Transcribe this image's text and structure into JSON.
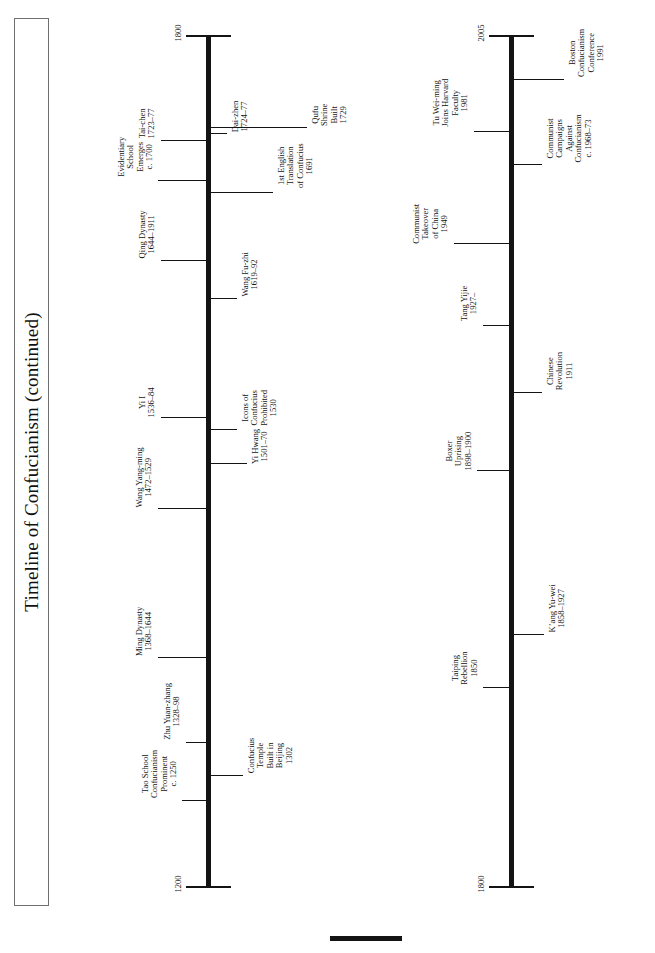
{
  "page": {
    "title": "Timeline of Confucianism (continued)",
    "background_color": "#ffffff",
    "ink_color": "#141414"
  },
  "chart_data": {
    "type": "timeline",
    "title": "Timeline of Confucianism (continued)",
    "orientation": "vertical-axis-rotated-page",
    "axes": [
      {
        "id": "upper-timeline",
        "start_year_label": "1200",
        "end_year_label": "1800",
        "range": [
          1200,
          1800
        ]
      },
      {
        "id": "lower-timeline",
        "start_year_label": "1800",
        "end_year_label": "2005",
        "range": [
          1800,
          2005
        ]
      }
    ],
    "events": [
      {
        "axis": "upper-timeline",
        "side": "left",
        "year": 1250,
        "lines": [
          "Tao School",
          "Confucianism",
          "Prominent",
          "c. 1250"
        ]
      },
      {
        "axis": "upper-timeline",
        "side": "right",
        "year": 1302,
        "lines": [
          "Confucius",
          "Temple",
          "Built in",
          "Beijing",
          "1302"
        ]
      },
      {
        "axis": "upper-timeline",
        "side": "left",
        "year": 1328,
        "lines": [
          "Zhu Yuan-zhang",
          "1328–98"
        ]
      },
      {
        "axis": "upper-timeline",
        "side": "left",
        "year": 1368,
        "lines": [
          "Ming Dynasty",
          "1368–1644"
        ]
      },
      {
        "axis": "upper-timeline",
        "side": "left",
        "year": 1472,
        "lines": [
          "Wang Yang-ming",
          "1472–1529"
        ]
      },
      {
        "axis": "upper-timeline",
        "side": "right",
        "year": 1501,
        "lines": [
          "Yi Hwang",
          "1501–70"
        ]
      },
      {
        "axis": "upper-timeline",
        "side": "right",
        "year": 1530,
        "lines": [
          "Icons of",
          "Confucius",
          "Prohibited",
          "1530"
        ]
      },
      {
        "axis": "upper-timeline",
        "side": "left",
        "year": 1536,
        "lines": [
          "Yi I",
          "1536–84"
        ]
      },
      {
        "axis": "upper-timeline",
        "side": "right",
        "year": 1619,
        "lines": [
          "Wang Fu-zhi",
          "1619–92"
        ]
      },
      {
        "axis": "upper-timeline",
        "side": "left",
        "year": 1644,
        "lines": [
          "Qing Dynasty",
          "1644–1911"
        ]
      },
      {
        "axis": "upper-timeline",
        "side": "right",
        "year": 1691,
        "lines": [
          "1st English",
          "Translation",
          "of Confucius",
          "1691"
        ]
      },
      {
        "axis": "upper-timeline",
        "side": "left",
        "year": 1700,
        "lines": [
          "Evidentiary",
          "School",
          "Emerges",
          "c. 1700"
        ]
      },
      {
        "axis": "upper-timeline",
        "side": "left",
        "year": 1723,
        "lines": [
          "Tai-chen",
          "1723–77"
        ]
      },
      {
        "axis": "upper-timeline",
        "side": "right",
        "year": 1724,
        "lines": [
          "Dai-zhen",
          "1724–77"
        ]
      },
      {
        "axis": "upper-timeline",
        "side": "right",
        "year": 1729,
        "lines": [
          "Qufu",
          "Shrine",
          "Built",
          "1729"
        ]
      },
      {
        "axis": "lower-timeline",
        "side": "left",
        "year": 1850,
        "lines": [
          "Taiping",
          "Rebellion",
          "1850"
        ]
      },
      {
        "axis": "lower-timeline",
        "side": "right",
        "year": 1858,
        "lines": [
          "K’ang Yu-wei",
          "1858–1927"
        ]
      },
      {
        "axis": "lower-timeline",
        "side": "left",
        "year": 1898,
        "lines": [
          "Boxer",
          "Uprising",
          "1898–1900"
        ]
      },
      {
        "axis": "lower-timeline",
        "side": "right",
        "year": 1911,
        "lines": [
          "Chinese",
          "Revolution",
          "1911"
        ]
      },
      {
        "axis": "lower-timeline",
        "side": "left",
        "year": 1927,
        "lines": [
          "Tang Yijie",
          "1927–"
        ]
      },
      {
        "axis": "lower-timeline",
        "side": "left",
        "year": 1949,
        "lines": [
          "Communist",
          "Takeover",
          "of China",
          "1949"
        ]
      },
      {
        "axis": "lower-timeline",
        "side": "right",
        "year": 1968,
        "lines": [
          "Communist",
          "Campaigns",
          "Against",
          "Confucianism",
          "c. 1968–73"
        ]
      },
      {
        "axis": "lower-timeline",
        "side": "left",
        "year": 1981,
        "lines": [
          "Tu Wei-ming",
          "Joins Harvard",
          "Faculty",
          "1981"
        ]
      },
      {
        "axis": "lower-timeline",
        "side": "right",
        "year": 1991,
        "lines": [
          "Boston",
          "Confucianism",
          "Conference",
          "1991"
        ]
      }
    ]
  },
  "upper_axis": {
    "top_year": "1800",
    "bottom_year": "1200"
  },
  "lower_axis": {
    "top_year": "2005",
    "bottom_year": "1800"
  },
  "events_upper_left": [
    {
      "lines": [
        "Tao School",
        "Confucianism",
        "Prominent",
        "c. 1250"
      ],
      "y": 800,
      "tick_len": 24,
      "label_gap": 4
    },
    {
      "lines": [
        "Zhu Yuan-zhang",
        "1328–98"
      ],
      "y": 742,
      "tick_len": 20,
      "label_gap": 4
    },
    {
      "lines": [
        "Ming Dynasty",
        "1368–1644"
      ],
      "y": 657,
      "tick_len": 48,
      "label_gap": 4
    },
    {
      "lines": [
        "Wang Yang-ming",
        "1472–1529"
      ],
      "y": 508,
      "tick_len": 48,
      "label_gap": 4
    },
    {
      "lines": [
        "Yi I",
        "1536–84"
      ],
      "y": 417,
      "tick_len": 45,
      "label_gap": 4
    },
    {
      "lines": [
        "Qing Dynasty",
        "1644–1911"
      ],
      "y": 260,
      "tick_len": 45,
      "label_gap": 4
    },
    {
      "lines": [
        "Evidentiary",
        "School",
        "Emerges",
        "c. 1700"
      ],
      "y": 180,
      "tick_len": 48,
      "label_gap": 4
    },
    {
      "lines": [
        "Tai-chen",
        "1723–77"
      ],
      "y": 140,
      "tick_len": 45,
      "label_gap": 4
    }
  ],
  "events_upper_right": [
    {
      "lines": [
        "Confucius",
        "Temple",
        "Built in",
        "Beijing",
        "1302"
      ],
      "y": 775,
      "tick_len": 32,
      "label_gap": 4
    },
    {
      "lines": [
        "Yi Hwang",
        "1501–70"
      ],
      "y": 463,
      "tick_len": 36,
      "label_gap": 4
    },
    {
      "lines": [
        "Icons of",
        "Confucius",
        "Prohibited",
        "1530"
      ],
      "y": 429,
      "tick_len": 26,
      "label_gap": 4
    },
    {
      "lines": [
        "Wang Fu-zhi",
        "1619–92"
      ],
      "y": 298,
      "tick_len": 26,
      "label_gap": 4
    },
    {
      "lines": [
        "1st English",
        "Translation",
        "of Confucius",
        "1691"
      ],
      "y": 192,
      "tick_len": 62,
      "label_gap": 4
    },
    {
      "lines": [
        "Dai-zhen",
        "1724–77"
      ],
      "y": 133,
      "tick_len": 16,
      "label_gap": 4
    },
    {
      "lines": [
        "Qufu",
        "Shrine",
        "Built",
        "1729"
      ],
      "y": 127,
      "tick_len": 96,
      "label_gap": 4
    }
  ],
  "events_lower_left": [
    {
      "lines": [
        "Taiping",
        "Rebellion",
        "1850"
      ],
      "y": 687,
      "tick_len": 26,
      "label_gap": 4
    },
    {
      "lines": [
        "Boxer",
        "Uprising",
        "1898–1900"
      ],
      "y": 470,
      "tick_len": 32,
      "label_gap": 4
    },
    {
      "lines": [
        "Tang Yijie",
        "1927–"
      ],
      "y": 325,
      "tick_len": 26,
      "label_gap": 4
    },
    {
      "lines": [
        "Communist",
        "Takeover",
        "of China",
        "1949"
      ],
      "y": 243,
      "tick_len": 55,
      "label_gap": 4
    },
    {
      "lines": [
        "Tu Wei-ming",
        "Joins Harvard",
        "Faculty",
        "1981"
      ],
      "y": 131,
      "tick_len": 35,
      "label_gap": 4
    }
  ],
  "events_lower_right": [
    {
      "lines": [
        "K’ang Yu-wei",
        "1858–1927"
      ],
      "y": 634,
      "tick_len": 30,
      "label_gap": 4
    },
    {
      "lines": [
        "Chinese",
        "Revolution",
        "1911"
      ],
      "y": 392,
      "tick_len": 28,
      "label_gap": 4
    },
    {
      "lines": [
        "Communist",
        "Campaigns",
        "Against",
        "Confucianism",
        "c. 1968–73"
      ],
      "y": 164,
      "tick_len": 28,
      "label_gap": 4
    },
    {
      "lines": [
        "Boston",
        "Confucianism",
        "Conference",
        "1991"
      ],
      "y": 79,
      "tick_len": 50,
      "label_gap": 4
    }
  ]
}
